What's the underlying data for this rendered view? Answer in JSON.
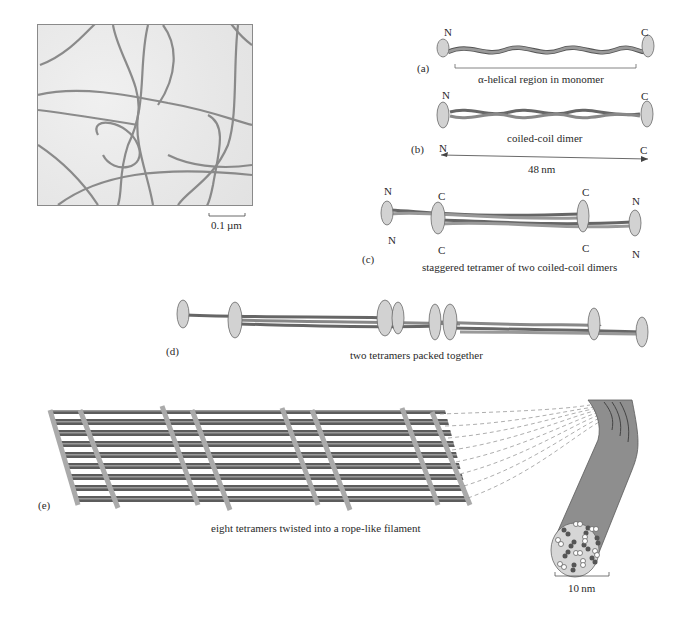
{
  "figure": {
    "micrograph": {
      "scale_bar_label": "0.1 µm"
    },
    "panels": [
      {
        "id": "a",
        "label": "(a)",
        "caption": "α-helical region in monomer",
        "termini": {
          "left": "N",
          "right": "C"
        }
      },
      {
        "id": "b",
        "label": "(b)",
        "caption": "coiled-coil dimer",
        "termini": {
          "left": "N",
          "right": "C"
        },
        "length_arrow": {
          "left": "N",
          "right": "C",
          "label": "48 nm"
        }
      },
      {
        "id": "c",
        "label": "(c)",
        "caption": "staggered tetramer of two coiled-coil dimers",
        "termini": {
          "outer_left_top": "N",
          "outer_left_bottom": "N",
          "inner_left_top": "C",
          "inner_left_bottom": "C",
          "inner_right_top": "C",
          "inner_right_bottom": "C",
          "outer_right_top": "N",
          "outer_right_bottom": "N"
        }
      },
      {
        "id": "d",
        "label": "(d)",
        "caption": "two tetramers packed together"
      },
      {
        "id": "e",
        "label": "(e)",
        "caption": "eight tetramers twisted into a rope-like filament",
        "scale_bar_label": "10 nm"
      }
    ],
    "colors": {
      "rod": "#8c8c8c",
      "rod_dark": "#5a5a5a",
      "head": "#d2d2d2",
      "head_outline": "#6a6a6a",
      "filament": "#8e8e8e",
      "cross_section": "#d6d6d6"
    }
  }
}
